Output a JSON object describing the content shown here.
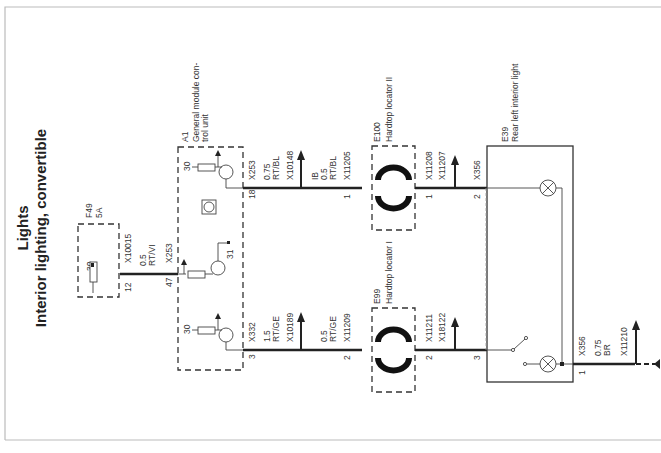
{
  "title": {
    "line1": "Lights",
    "line2": "Interior lighting, convertible"
  },
  "components": {
    "fuse": {
      "id": "F49",
      "rating": "5A",
      "pin": "30",
      "terminal": "12",
      "connector": "X10015"
    },
    "module": {
      "id": "A1",
      "name_line1": "General module con-",
      "name_line2": "trol unit",
      "pins": {
        "top": "30",
        "middle": "31",
        "bottom": "30"
      },
      "terminals": {
        "top": "18",
        "middle": "47",
        "bottom": "3"
      },
      "connectors": {
        "top": "X253",
        "middle": "X253",
        "bottom": "X332"
      }
    },
    "locator_2": {
      "id": "E100",
      "name": "Hardtop locator II",
      "pin_in": "1",
      "pin_out": "1",
      "connector_in": "X11205",
      "connector_out": "X11208"
    },
    "locator_1": {
      "id": "E99",
      "name": "Hardtop locator I",
      "pin_in": "2",
      "pin_out": "2",
      "connector_in": "X11209",
      "connector_out": "X11211"
    },
    "light": {
      "id": "E39",
      "name": "Rear left interior light",
      "pins": {
        "top": "2",
        "bottom_in": "3",
        "ground": "1"
      },
      "connectors": {
        "top": "X356",
        "ground": "X356"
      }
    }
  },
  "wires": {
    "fuse_to_module": {
      "gauge": "0.5",
      "color": "RT/VI"
    },
    "module_top_out": {
      "gauge": "0.75",
      "color": "RT/BL",
      "splice": "X10148"
    },
    "locator2_in": {
      "prefix": "IB",
      "gauge": "0.5",
      "color": "RT/BL"
    },
    "module_bottom_out": {
      "gauge": "1.5",
      "color": "RT/GE",
      "splice": "X10189"
    },
    "locator1_in": {
      "gauge": "0.5",
      "color": "RT/GE"
    },
    "locator2_out_splice": "X11207",
    "locator1_out_splice": "X18122",
    "ground": {
      "gauge": "0.75",
      "color": "BR",
      "splice": "X11210"
    }
  }
}
